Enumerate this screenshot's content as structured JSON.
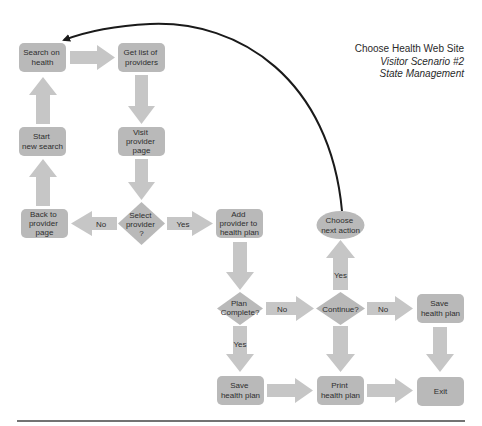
{
  "title": {
    "line1": "Choose Health Web Site",
    "line2": "Visitor Scenario #2",
    "line3": "State Management"
  },
  "colors": {
    "node_fill": "#b9b9b9",
    "arrow_fill": "#c6c6c6",
    "text": "#2e2e2e",
    "connector": "#1a1a1a",
    "rule": "#444444"
  },
  "nodes": {
    "search_on_health": [
      "Search on",
      "health"
    ],
    "get_list_of_providers": [
      "Get list of",
      "providers"
    ],
    "start_new_search": [
      "Start",
      "new search"
    ],
    "visit_provider_page": [
      "Visit",
      "provider",
      "page"
    ],
    "back_to_provider_page": [
      "Back to",
      "provider",
      "page"
    ],
    "select_provider": [
      "Select",
      "provider",
      "?"
    ],
    "add_provider_to_health_plan": [
      "Add",
      "provider to",
      "health plan"
    ],
    "choose_next_action": [
      "Choose",
      "next action"
    ],
    "plan_complete": [
      "Plan",
      "Complete?"
    ],
    "continue": [
      "Continue?"
    ],
    "save_health_plan_right": [
      "Save",
      "health plan"
    ],
    "save_health_plan_bottom": [
      "Save",
      "health plan"
    ],
    "print_health_plan": [
      "Print",
      "health plan"
    ],
    "exit": [
      "Exit"
    ]
  },
  "edge_labels": {
    "select_no": "No",
    "select_yes": "Yes",
    "plan_no": "No",
    "plan_yes": "Yes",
    "continue_no": "No",
    "continue_yes": "Yes"
  }
}
